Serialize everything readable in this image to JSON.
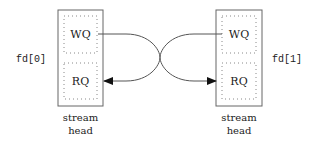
{
  "diagram": {
    "left": {
      "fd_label": "fd[0]",
      "write_queue": "WQ",
      "read_queue": "RQ",
      "caption_line1": "stream",
      "caption_line2": "head"
    },
    "right": {
      "fd_label": "fd[1]",
      "write_queue": "WQ",
      "read_queue": "RQ",
      "caption_line1": "stream",
      "caption_line2": "head"
    },
    "connections": [
      {
        "from": "left.WQ",
        "to": "right.RQ"
      },
      {
        "from": "right.WQ",
        "to": "left.RQ"
      }
    ]
  }
}
